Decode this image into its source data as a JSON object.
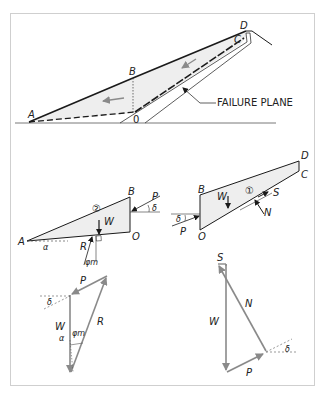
{
  "figure": {
    "title": "",
    "colors": {
      "line": "#1a1a1a",
      "fill": "#eeeeee",
      "arrow_grey": "#8a8a8a",
      "frame": "#cfcfcf"
    }
  },
  "top_section": {
    "points": {
      "A": "A",
      "B": "B",
      "C": "C",
      "D": "D",
      "O": "0"
    },
    "failure_plane_label": "FAILURE PLANE"
  },
  "wedge_2": {
    "points": {
      "A": "A",
      "B": "B",
      "O": "O"
    },
    "number": "②",
    "forces": {
      "W": "W",
      "P": "P",
      "R": "R"
    },
    "angles": {
      "alpha": "α",
      "delta": "δ",
      "phi_m": "φm"
    }
  },
  "wedge_1": {
    "points": {
      "B": "B",
      "C": "C",
      "D": "D",
      "O": "O"
    },
    "number": "①",
    "forces": {
      "W": "W",
      "P": "P",
      "S": "S",
      "N": "N"
    },
    "angles": {
      "delta": "δ"
    }
  },
  "polygon_2": {
    "forces": {
      "P": "P",
      "W": "W",
      "R": "R"
    },
    "angles": {
      "delta": "δ",
      "alpha": "α",
      "phi_m": "φm"
    }
  },
  "polygon_1": {
    "forces": {
      "S": "S",
      "N": "N",
      "W": "W",
      "P": "P"
    },
    "angles": {
      "delta": "δ"
    }
  }
}
